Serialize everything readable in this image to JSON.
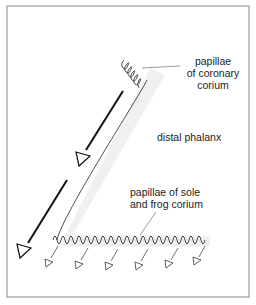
{
  "figure": {
    "labels": {
      "coronary_line1": "papillae",
      "coronary_line2": "of coronary",
      "coronary_line3": "corium",
      "phalanx": "distal phalanx",
      "sole_line1": "papillae of sole",
      "sole_line2": "and frog corium"
    },
    "colors": {
      "ink": "#1a1a1a",
      "frame": "#555555",
      "shadow": "#e8e8e8"
    },
    "icons": [
      "large-arrow-icon",
      "small-arrow-icon"
    ]
  }
}
